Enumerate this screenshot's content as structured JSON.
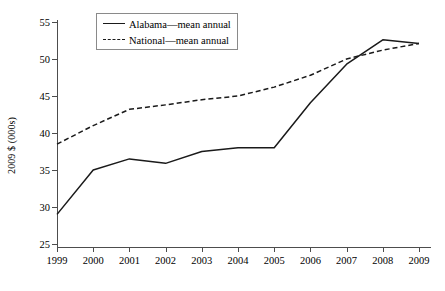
{
  "chart_data": {
    "type": "line",
    "title": "",
    "xlabel": "",
    "ylabel": "2009 $ (000s)",
    "categories": [
      "1999",
      "2000",
      "2001",
      "2002",
      "2003",
      "2004",
      "2005",
      "2006",
      "2007",
      "2008",
      "2009"
    ],
    "x": [
      1999,
      2000,
      2001,
      2002,
      2003,
      2004,
      2005,
      2006,
      2007,
      2008,
      2009
    ],
    "series": [
      {
        "name": "Alabama—mean annual",
        "style": "solid",
        "color": "#1a1a1a",
        "values": [
          29.0,
          35.0,
          36.5,
          35.9,
          37.5,
          38.0,
          38.0,
          44.1,
          49.3,
          52.6,
          52.1
        ]
      },
      {
        "name": "National—mean annual",
        "style": "dashed",
        "color": "#1a1a1a",
        "values": [
          38.5,
          41.0,
          43.2,
          43.8,
          44.5,
          45.0,
          46.2,
          47.8,
          50.0,
          51.2,
          52.1
        ]
      }
    ],
    "ylim": [
      25,
      55
    ],
    "yticks": [
      25,
      30,
      35,
      40,
      45,
      50,
      55
    ],
    "ytick_labels": [
      "25",
      "30",
      "35",
      "40",
      "45",
      "50",
      "55"
    ],
    "xtick_labels": [
      "1999",
      "2000",
      "2001",
      "2002",
      "2003",
      "2004",
      "2005",
      "2006",
      "2007",
      "2008",
      "2009"
    ],
    "grid": false,
    "legend_position": "top-left-inside",
    "legend_entries": [
      {
        "label": "Alabama—mean annual",
        "style": "solid"
      },
      {
        "label": "National—mean annual",
        "style": "dashed"
      }
    ]
  }
}
